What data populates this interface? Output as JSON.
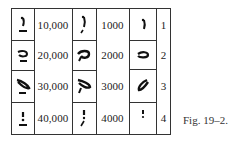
{
  "figure": {
    "caption": "Fig. 19–2.",
    "columns": [
      {
        "name": "ten-thousands-glyphs",
        "type": "glyph"
      },
      {
        "name": "ten-thousands-values",
        "type": "value"
      },
      {
        "name": "thousands-glyphs",
        "type": "glyph"
      },
      {
        "name": "thousands-values",
        "type": "value"
      },
      {
        "name": "units-glyphs",
        "type": "glyph"
      },
      {
        "name": "units-index",
        "type": "index"
      }
    ],
    "rows": [
      {
        "ten_thousands": "10,000",
        "thousands": "1000",
        "index": "1",
        "glyph_tt": "hieratic-1-tt",
        "glyph_th": "hieratic-1-th",
        "glyph_u": "hieratic-1-u"
      },
      {
        "ten_thousands": "20,000",
        "thousands": "2000",
        "index": "2",
        "glyph_tt": "hieratic-2-tt",
        "glyph_th": "hieratic-2-th",
        "glyph_u": "hieratic-2-u"
      },
      {
        "ten_thousands": "30,000",
        "thousands": "3000",
        "index": "3",
        "glyph_tt": "hieratic-3-tt",
        "glyph_th": "hieratic-3-th",
        "glyph_u": "hieratic-3-u"
      },
      {
        "ten_thousands": "40,000",
        "thousands": "4000",
        "index": "4",
        "glyph_tt": "hieratic-4-tt",
        "glyph_th": "hieratic-4-th",
        "glyph_u": "hieratic-4-u"
      }
    ]
  }
}
